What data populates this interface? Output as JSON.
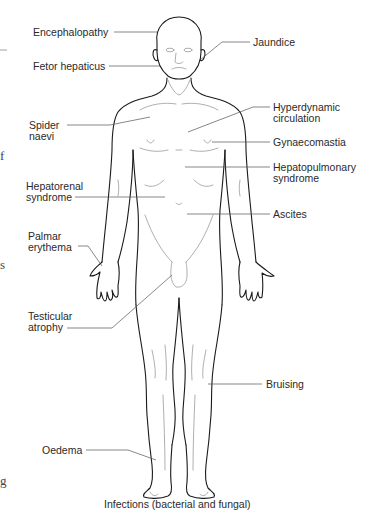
{
  "figure": {
    "labels": {
      "encephalopathy": "Encephalopathy",
      "jaundice": "Jaundice",
      "fetor_hepaticus": "Fetor hepaticus",
      "spider_naevi_1": "Spider",
      "spider_naevi_2": "naevi",
      "hyperdynamic_1": "Hyperdynamic",
      "hyperdynamic_2": "circulation",
      "gynaecomastia": "Gynaecomastia",
      "hepatopulmonary_1": "Hepatopulmonary",
      "hepatopulmonary_2": "syndrome",
      "hepatorenal_1": "Hepatorenal",
      "hepatorenal_2": "syndrome",
      "ascites": "Ascites",
      "palmar_1": "Palmar",
      "palmar_2": "erythema",
      "testicular_1": "Testicular",
      "testicular_2": "atrophy",
      "bruising": "Bruising",
      "oedema": "Oedema",
      "infections": "Infections (bacterial and fungal)"
    },
    "margin_fragments": {
      "f": "f",
      "s": "s",
      "g": "g"
    },
    "colors": {
      "outline": "#1a1a1a",
      "detail": "#9a9a9a",
      "leader": "#555555",
      "text": "#2a2a2a"
    }
  }
}
